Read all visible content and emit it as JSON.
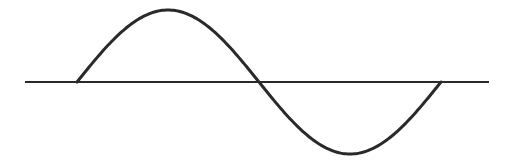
{
  "diagram": {
    "type": "sine-wave",
    "cycles": 1,
    "colors": {
      "background": "#ffffff",
      "stroke": "#2a2a2a"
    },
    "axis": {
      "x1": 25,
      "x2": 489,
      "y": 82
    },
    "wave": {
      "start_x": 77,
      "end_x": 441,
      "baseline_y": 82,
      "amplitude": 72,
      "peak": {
        "x": 168,
        "y": 10
      },
      "trough": {
        "x": 350,
        "y": 155
      }
    }
  }
}
